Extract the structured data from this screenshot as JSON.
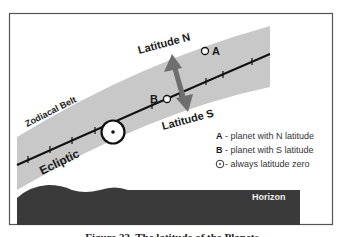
{
  "figure": {
    "caption": "Figure 23. The latitude of the Planets"
  },
  "labels": {
    "zodiacal_belt": "Zodiacal Belt",
    "ecliptic": "Ecliptic",
    "latitude_n": "Latitude N",
    "latitude_s": "Latitude S",
    "planet_a": "A",
    "planet_b": "B",
    "horizon": "Horizon"
  },
  "legend": {
    "items": [
      {
        "key": "A",
        "text": " - planet with N latitude"
      },
      {
        "key": "B",
        "text": " - planet with S latitude"
      },
      {
        "key": "sun-symbol",
        "text": " - always latitude zero"
      }
    ]
  },
  "colors": {
    "belt": "#c8c8c8",
    "horizon": "#3a3a3a",
    "arrow": "#6e6e6e",
    "line": "#111111",
    "frame": "#555555"
  }
}
